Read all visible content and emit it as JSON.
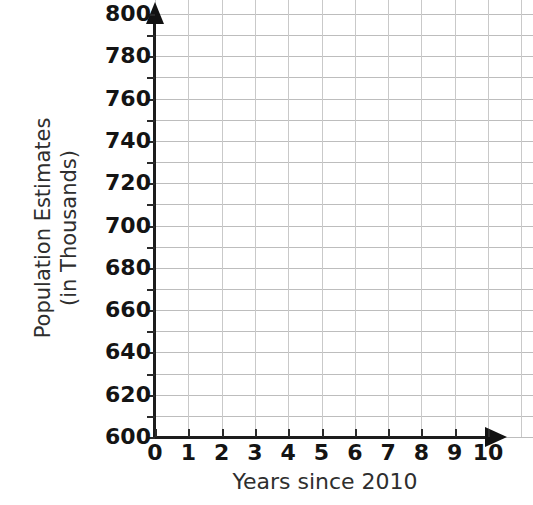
{
  "chart_data": {
    "type": "line",
    "title": "",
    "subtitle": "",
    "xlabel": "Years since 2010",
    "ylabel": "Population Estimates (in Thousands)",
    "ylabel_lines": [
      "Population Estimates",
      "(in Thousands)"
    ],
    "x": [],
    "values": [],
    "series": [],
    "annotations": [],
    "legend": [],
    "legend_position": "none",
    "grid": true,
    "grid_minor": true,
    "xlim": [
      0,
      10
    ],
    "ylim": [
      600,
      800
    ],
    "x_tick_step": 1,
    "y_tick_step": 20,
    "y_minor_step": 10,
    "x_ticks": [
      "0",
      "1",
      "2",
      "3",
      "4",
      "5",
      "6",
      "7",
      "8",
      "9",
      "10"
    ],
    "y_ticks": [
      "600",
      "620",
      "640",
      "660",
      "680",
      "700",
      "720",
      "740",
      "760",
      "780",
      "800"
    ],
    "note": "Blank coordinate grid with no plotted data",
    "colors": {
      "background": "#ffffff",
      "axis": "#1c1c1c",
      "gridline_major": "#bdbdbd",
      "gridline_minor": "#c9c9c9",
      "tick_label": "#141414",
      "axis_title": "#2e2e2e"
    }
  }
}
